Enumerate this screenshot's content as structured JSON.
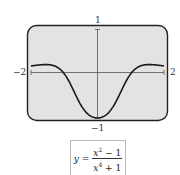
{
  "graph": {
    "x_min_label": "−2",
    "x_max_label": "2",
    "y_max_label": "1",
    "y_min_label": "−1",
    "screen_fill": "#e3e3e3",
    "curve_color": "#1a1a1a"
  },
  "formula": {
    "lhs": "y =",
    "num_var": "x",
    "num_exp": "2",
    "num_rest": " − 1",
    "den_var": "x",
    "den_exp": "4",
    "den_rest": " + 1"
  },
  "chart_data": {
    "type": "line",
    "title": "",
    "function": "y = (x^2 - 1)/(x^4 + 1)",
    "xlim": [
      -2,
      2
    ],
    "ylim": [
      -1,
      1
    ],
    "x": [
      -2,
      -1.5,
      -1,
      -0.5,
      0,
      0.5,
      1,
      1.5,
      2
    ],
    "y": [
      0.176,
      0.205,
      0,
      -0.706,
      -1,
      -0.706,
      0,
      0.205,
      0.176
    ],
    "tick_labels": {
      "x": [
        "−2",
        "2"
      ],
      "y": [
        "1",
        "−1"
      ]
    },
    "grid": false
  }
}
